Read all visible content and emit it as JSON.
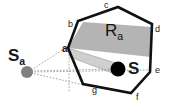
{
  "figure": {
    "type": "geometry-diagram",
    "background_color": "#ffffff",
    "stroke_color": "#111111",
    "region_fill": "#b4b4b4",
    "wedge_fill": "#cfcfcf",
    "dot_source_color": "#808080",
    "dot_target_color": "#000000",
    "dotted_line_color": "#9a9a9a"
  },
  "labels": {
    "external_point": "S",
    "external_point_sub": "a",
    "internal_point": "S",
    "region": "R",
    "region_sub": "a",
    "vertex_a": "a",
    "edge_b": "b",
    "edge_c": "c",
    "edge_d": "d",
    "edge_e": "e",
    "edge_f": "f",
    "edge_g": "g"
  },
  "geometry": {
    "polygon_vertices": [
      [
        68,
        48
      ],
      [
        78,
        21
      ],
      [
        118,
        7
      ],
      [
        152,
        24
      ],
      [
        150,
        72
      ],
      [
        131,
        93
      ],
      [
        83,
        84
      ]
    ],
    "region_band": [
      [
        68,
        48
      ],
      [
        83,
        22
      ],
      [
        152,
        27
      ],
      [
        151,
        57
      ]
    ],
    "wedge": [
      [
        68,
        48
      ],
      [
        118,
        66
      ],
      [
        111,
        72
      ],
      [
        70,
        57
      ]
    ],
    "source_dot": [
      27,
      72
    ],
    "source_dot_r": 6,
    "target_dot": [
      118,
      69
    ],
    "target_dot_r": 7,
    "sight_lines": [
      [
        [
          27,
          72
        ],
        [
          70,
          44
        ]
      ],
      [
        [
          27,
          72
        ],
        [
          118,
          69
        ]
      ],
      [
        [
          27,
          72
        ],
        [
          84,
          85
        ]
      ],
      [
        [
          27,
          72
        ],
        [
          152,
          71
        ]
      ]
    ]
  }
}
